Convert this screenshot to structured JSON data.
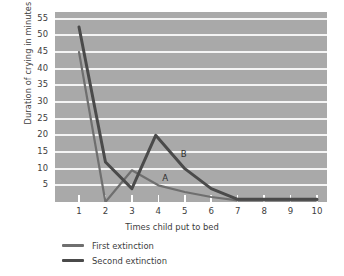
{
  "chart_data": {
    "type": "line",
    "title": "",
    "xlabel": "Times child put to bed",
    "ylabel": "Duration of crying in minutes",
    "xlim": [
      1,
      10
    ],
    "ylim": [
      0,
      57
    ],
    "yticks": [
      5,
      10,
      15,
      20,
      25,
      30,
      35,
      40,
      45,
      50,
      55
    ],
    "xticks": [
      1,
      2,
      3,
      4,
      5,
      6,
      7,
      8,
      9,
      10
    ],
    "grid": "horizontal",
    "legend_position": "below-left",
    "x": [
      1,
      2,
      3,
      4,
      5,
      6,
      7,
      8,
      9,
      10
    ],
    "series": [
      {
        "name": "First extinction",
        "color": "#6f6f6f",
        "values": [
          45,
          0,
          9.5,
          5,
          3,
          1.5,
          0.5,
          0.5,
          0.5,
          0.5
        ]
      },
      {
        "name": "Second extinction",
        "color": "#4a4a4a",
        "values": [
          52.5,
          12,
          4,
          20,
          10,
          4,
          0.8,
          0.8,
          0.8,
          0.8
        ]
      }
    ],
    "annotations": [
      {
        "label": "A",
        "x": 4.15,
        "y": 7.0,
        "series": "First extinction"
      },
      {
        "label": "B",
        "x": 4.85,
        "y": 14.0,
        "series": "Second extinction"
      }
    ]
  },
  "legend": {
    "items": [
      {
        "label": "First extinction"
      },
      {
        "label": "Second extinction"
      }
    ]
  }
}
